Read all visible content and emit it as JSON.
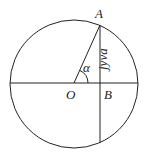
{
  "diagram": {
    "type": "geometry",
    "labels": {
      "point_a": "A",
      "point_o": "O",
      "point_b": "B",
      "angle": "α",
      "segment_ab": "jyva"
    },
    "colors": {
      "stroke": "#222222",
      "background": "#ffffff"
    }
  }
}
